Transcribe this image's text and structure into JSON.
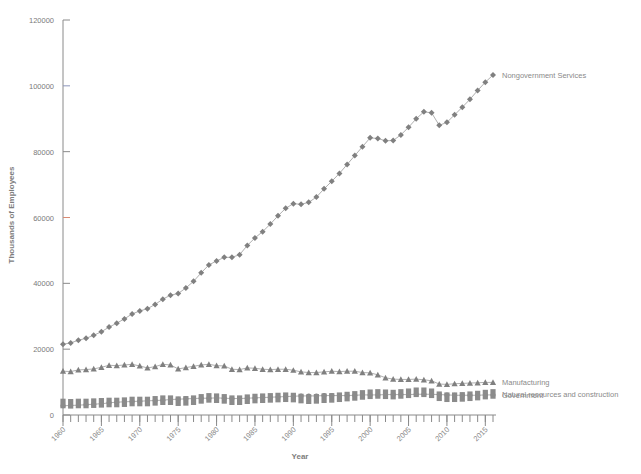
{
  "figure": {
    "background": "#ffffff",
    "marker_color": "#808080",
    "line_color": "#9a9a9a",
    "axis_color": "#8a8a8a",
    "text_color": "#7a7a7a",
    "accent_tick_blue": "#8d95bb",
    "accent_tick_red": "#d98a73"
  },
  "chart_data": {
    "type": "line",
    "title": "",
    "xlabel": "Year",
    "ylabel": "Thousands of Employees",
    "xlim": [
      1960,
      2016
    ],
    "ylim": [
      0,
      120000
    ],
    "ytick_labels": [
      "0",
      "20000",
      "40000",
      "60000",
      "80000",
      "100000",
      "120000"
    ],
    "yticks": [
      0,
      20000,
      40000,
      60000,
      80000,
      100000,
      120000
    ],
    "xtick_labels": [
      "1960",
      "1965",
      "1970",
      "1975",
      "1980",
      "1985",
      "1990",
      "1995",
      "2000",
      "2005",
      "2010",
      "2015"
    ],
    "xticks": [
      1960,
      1965,
      1970,
      1975,
      1980,
      1985,
      1990,
      1995,
      2000,
      2005,
      2010,
      2015
    ],
    "xtick_rotation": 45,
    "grid": false,
    "legend_position": "right-inline-labels",
    "x": [
      1960,
      1961,
      1962,
      1963,
      1964,
      1965,
      1966,
      1967,
      1968,
      1969,
      1970,
      1971,
      1972,
      1973,
      1974,
      1975,
      1976,
      1977,
      1978,
      1979,
      1980,
      1981,
      1982,
      1983,
      1984,
      1985,
      1986,
      1987,
      1988,
      1989,
      1990,
      1991,
      1992,
      1993,
      1994,
      1995,
      1996,
      1997,
      1998,
      1999,
      2000,
      2001,
      2002,
      2003,
      2004,
      2005,
      2006,
      2007,
      2008,
      2009,
      2010,
      2011,
      2012,
      2013,
      2014,
      2015,
      2016
    ],
    "series": [
      {
        "name": "Nongovernment Services",
        "marker": "diamond",
        "label_x": 2016,
        "values": [
          21500,
          21900,
          22700,
          23300,
          24200,
          25300,
          26700,
          27900,
          29200,
          30700,
          31600,
          32300,
          33600,
          35200,
          36400,
          36900,
          38600,
          40600,
          43200,
          45600,
          46800,
          47900,
          47900,
          48700,
          51500,
          53800,
          55700,
          58000,
          60500,
          62800,
          64200,
          64000,
          64600,
          66200,
          68700,
          71000,
          73400,
          76100,
          78800,
          81500,
          84200,
          84000,
          83300,
          83400,
          85100,
          87400,
          90000,
          92100,
          91800,
          88000,
          88900,
          91200,
          93500,
          95900,
          98600,
          101100,
          103300
        ]
      },
      {
        "name": "Manufacturing",
        "marker": "triangle",
        "label_x": 2016,
        "values": [
          13300,
          13200,
          13700,
          13800,
          14000,
          14500,
          15100,
          15000,
          15200,
          15400,
          14900,
          14300,
          14700,
          15400,
          15200,
          14000,
          14400,
          14800,
          15200,
          15400,
          15000,
          14900,
          13900,
          13800,
          14300,
          14200,
          13900,
          13800,
          13900,
          13900,
          13600,
          13100,
          12900,
          12900,
          13100,
          13300,
          13200,
          13300,
          13300,
          12900,
          12800,
          12200,
          11300,
          10900,
          10800,
          10800,
          10900,
          10700,
          10400,
          9400,
          9300,
          9500,
          9600,
          9700,
          9800,
          9900,
          9900
        ]
      },
      {
        "name": "Government",
        "marker": "circle",
        "label_x": 2016,
        "values": [
          2800,
          2900,
          3000,
          3100,
          3300,
          3400,
          3700,
          3900,
          4000,
          4100,
          4200,
          4300,
          4400,
          4500,
          4700,
          4800,
          4900,
          5000,
          5100,
          5100,
          5200,
          5100,
          5000,
          5000,
          5100,
          5200,
          5300,
          5400,
          5500,
          5600,
          5700,
          5800,
          5800,
          5800,
          5900,
          5900,
          5900,
          5900,
          6000,
          6100,
          6100,
          6100,
          6200,
          6200,
          6200,
          6200,
          6300,
          6300,
          6300,
          6200,
          6100,
          6000,
          6000,
          6000,
          6000,
          6100,
          6100
        ]
      },
      {
        "name": "Natural resources and construction",
        "marker": "square",
        "label_x": 2016,
        "values": [
          3500,
          3400,
          3500,
          3500,
          3600,
          3700,
          3800,
          3800,
          3900,
          4100,
          4100,
          4100,
          4300,
          4500,
          4500,
          4200,
          4300,
          4500,
          4900,
          5200,
          5100,
          4900,
          4500,
          4500,
          4800,
          5000,
          5100,
          5200,
          5300,
          5400,
          5300,
          5000,
          4800,
          4900,
          5100,
          5200,
          5400,
          5600,
          5800,
          6100,
          6300,
          6400,
          6300,
          6200,
          6400,
          6600,
          6900,
          6900,
          6600,
          5700,
          5400,
          5400,
          5500,
          5700,
          5900,
          6200,
          6400
        ]
      }
    ]
  },
  "axes": {
    "y_title": "Thousands of Employees",
    "x_title": "Year"
  }
}
